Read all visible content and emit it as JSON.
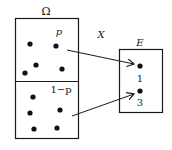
{
  "diagram": {
    "sample_space": {
      "label": "Ω",
      "upper_region": {
        "label": "p",
        "dots": [
          [
            30,
            44
          ],
          [
            56,
            46
          ],
          [
            36,
            65
          ],
          [
            25,
            73
          ],
          [
            62,
            69
          ]
        ]
      },
      "lower_region": {
        "label": "1−p",
        "dots": [
          [
            33,
            97
          ],
          [
            30,
            113
          ],
          [
            60,
            110
          ],
          [
            34,
            129
          ],
          [
            57,
            128
          ]
        ]
      }
    },
    "mapping": {
      "label": "X"
    },
    "codomain": {
      "label": "E",
      "points": [
        {
          "value": "1"
        },
        {
          "value": "3"
        }
      ]
    },
    "arrows": [
      {
        "from": "upper_region",
        "to": "1"
      },
      {
        "from": "lower_region",
        "to": "3"
      }
    ],
    "colors": {
      "stroke": "#1a1a1a",
      "background": "#ffffff"
    }
  }
}
